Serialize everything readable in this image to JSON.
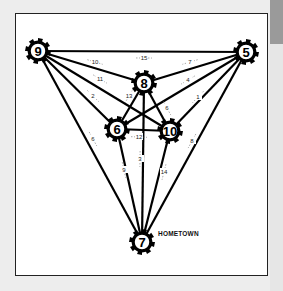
{
  "diagram": {
    "type": "weighted-graph",
    "caption": "HOMETOWN",
    "caption_node": "7",
    "colors": {
      "background": "#ededed",
      "frame": "#ffffff",
      "ink": "#000000",
      "side_tab": "#9a9a9a"
    },
    "nodes": [
      {
        "id": "9",
        "label": "9",
        "x": 38,
        "y": 51
      },
      {
        "id": "5",
        "label": "5",
        "x": 246,
        "y": 52
      },
      {
        "id": "8",
        "label": "8",
        "x": 144,
        "y": 83
      },
      {
        "id": "6",
        "label": "6",
        "x": 117,
        "y": 129
      },
      {
        "id": "10",
        "label": "10",
        "x": 170,
        "y": 131
      },
      {
        "id": "7",
        "label": "7",
        "x": 142,
        "y": 242
      }
    ],
    "edges": [
      {
        "from": "9",
        "to": "5",
        "weight": "15",
        "lx": 144,
        "ly": 60
      },
      {
        "from": "9",
        "to": "8",
        "weight": "10",
        "lx": 95,
        "ly": 64
      },
      {
        "from": "9",
        "to": "10",
        "weight": "11",
        "lx": 100,
        "ly": 81
      },
      {
        "from": "9",
        "to": "6",
        "weight": "2",
        "lx": 93,
        "ly": 98
      },
      {
        "from": "9",
        "to": "7",
        "weight": "6",
        "lx": 93,
        "ly": 141
      },
      {
        "from": "5",
        "to": "8",
        "weight": "7",
        "lx": 190,
        "ly": 64
      },
      {
        "from": "5",
        "to": "6",
        "weight": "4",
        "lx": 188,
        "ly": 82
      },
      {
        "from": "5",
        "to": "10",
        "weight": "1",
        "lx": 198,
        "ly": 99
      },
      {
        "from": "5",
        "to": "7",
        "weight": "8",
        "lx": 192,
        "ly": 143
      },
      {
        "from": "8",
        "to": "6",
        "weight": "13",
        "lx": 129,
        "ly": 98
      },
      {
        "from": "8",
        "to": "10",
        "weight": "6",
        "lx": 167,
        "ly": 110
      },
      {
        "from": "8",
        "to": "7",
        "weight": "3",
        "lx": 140,
        "ly": 161
      },
      {
        "from": "6",
        "to": "10",
        "weight": "12",
        "lx": 139,
        "ly": 139
      },
      {
        "from": "6",
        "to": "7",
        "weight": "9",
        "lx": 124,
        "ly": 172
      },
      {
        "from": "10",
        "to": "7",
        "weight": "14",
        "lx": 164,
        "ly": 174
      }
    ]
  }
}
